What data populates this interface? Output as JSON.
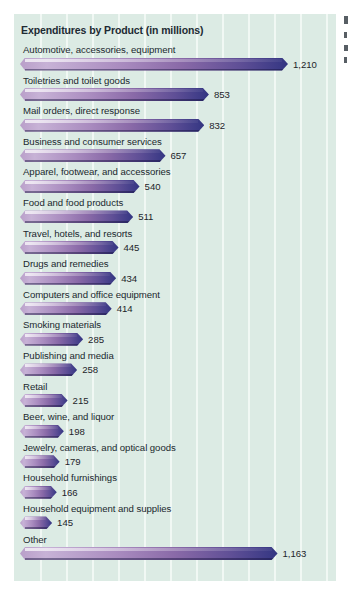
{
  "chart_data": {
    "type": "bar",
    "orientation": "horizontal",
    "title": "Expenditures by Product (in millions)",
    "xlabel": "",
    "ylabel": "",
    "grid": true,
    "gridlines_vertical": true,
    "legend": false,
    "xlim": [
      0,
      1300
    ],
    "categories": [
      "Automotive, accessories, equipment",
      "Toiletries and toilet goods",
      "Mail orders, direct response",
      "Business and consumer services",
      "Apparel, footwear, and accessories",
      "Food and food products",
      "Travel, hotels, and resorts",
      "Drugs and remedies",
      "Computers and office equipment",
      "Smoking materials",
      "Publishing and media",
      "Retail",
      "Beer, wine, and liquor",
      "Jewelry, cameras, and optical goods",
      "Household furnishings",
      "Household equipment and supplies",
      "Other"
    ],
    "values": [
      1210,
      853,
      832,
      657,
      540,
      511,
      445,
      434,
      414,
      285,
      258,
      215,
      198,
      179,
      166,
      145,
      1163
    ],
    "value_labels": [
      "1,210",
      "853",
      "832",
      "657",
      "540",
      "511",
      "445",
      "434",
      "414",
      "285",
      "258",
      "215",
      "198",
      "179",
      "166",
      "145",
      "1,163"
    ],
    "colors": {
      "panel_background": "#dcebe4",
      "gridline": "#f4faf7",
      "bar_light": "#c7b2d6",
      "bar_mid": "#8a6aa8",
      "bar_dark": "#32357f",
      "text": "#20282e",
      "title_text": "#1d2a33",
      "page_background": "#ffffff"
    }
  },
  "panel": {
    "title": "Expenditures by Product (in millions)"
  }
}
